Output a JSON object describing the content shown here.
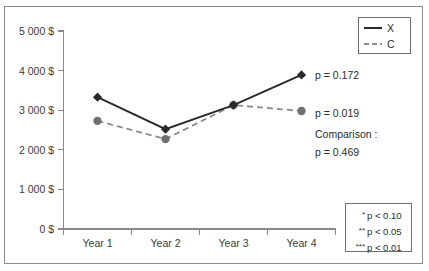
{
  "chart_data": {
    "type": "line",
    "title": "",
    "xlabel": "",
    "ylabel": "",
    "categories": [
      "Year 1",
      "Year 2",
      "Year 3",
      "Year 4"
    ],
    "ylim": [
      0,
      5000
    ],
    "ytick_values": [
      0,
      1000,
      2000,
      3000,
      4000,
      5000
    ],
    "ytick_labels": [
      "0 $",
      "1 000 $",
      "2 000 $",
      "3 000 $",
      "4 000 $",
      "5 000 $"
    ],
    "grid": false,
    "legend_position": "top-right",
    "series": [
      {
        "name": "X",
        "style": "solid",
        "marker": "diamond",
        "color": "#2a2a2a",
        "values": [
          3330,
          2520,
          3130,
          3890
        ]
      },
      {
        "name": "C",
        "style": "dashed",
        "marker": "circle",
        "color": "#8d8d8d",
        "values": [
          2730,
          2270,
          3130,
          2980
        ]
      }
    ],
    "annotations": [
      {
        "id": "p-x",
        "text": "p = 0.172"
      },
      {
        "id": "p-c",
        "text": "p = 0.019"
      },
      {
        "id": "comparison-label",
        "text": "Comparison :"
      },
      {
        "id": "comparison-p",
        "text": "p = 0.469"
      }
    ]
  },
  "legend": {
    "entries": [
      {
        "label": "X",
        "style": "solid"
      },
      {
        "label": "C",
        "style": "dashed"
      }
    ]
  },
  "significance_note": {
    "lines": [
      {
        "stars": "*",
        "text": "p < 0.10"
      },
      {
        "stars": "**",
        "text": "p < 0.05"
      },
      {
        "stars": "***",
        "text": "p < 0.01"
      }
    ]
  },
  "axis": {
    "y_labels": [
      "5 000 $",
      "4 000 $",
      "3 000 $",
      "2 000 $",
      "1 000 $",
      "0 $"
    ],
    "x_labels": [
      "Year 1",
      "Year 2",
      "Year 3",
      "Year 4"
    ]
  }
}
